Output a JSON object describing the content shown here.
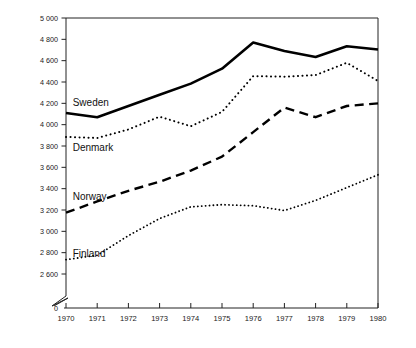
{
  "chart_data": {
    "type": "line",
    "title": "",
    "subtitle": "",
    "xlabel": "",
    "ylabel": "",
    "x": [
      1970,
      1971,
      1972,
      1973,
      1974,
      1975,
      1976,
      1977,
      1978,
      1979,
      1980
    ],
    "xtick_labels": [
      "1970",
      "1971",
      "1972",
      "1973",
      "1974",
      "1975",
      "1976",
      "1977",
      "1978",
      "1979",
      "1980"
    ],
    "ytick_labels": [
      "0",
      "2 600",
      "2 800",
      "3 000",
      "3 200",
      "3 400",
      "3 600",
      "3 800",
      "4 000",
      "4 200",
      "4 400",
      "4 600",
      "4 800",
      "5 000"
    ],
    "ytick_values": [
      0,
      2600,
      2800,
      3000,
      3200,
      3400,
      3600,
      3800,
      4000,
      4200,
      4400,
      4600,
      4800,
      5000
    ],
    "ylim": [
      2600,
      5000
    ],
    "xlim": [
      1970,
      1980
    ],
    "axis_break": true,
    "axis_break_note": "y-axis broken between 0 and 2 600",
    "grid": false,
    "legend_position": "inline-left",
    "series": [
      {
        "name": "Sweden",
        "style": "solid",
        "linewidth": 2.6,
        "color": "#000000",
        "label_x": 1970.15,
        "label_y": 4210,
        "values": [
          4110,
          4070,
          4175,
          4280,
          4385,
          4525,
          4770,
          4690,
          4635,
          4735,
          4705
        ]
      },
      {
        "name": "Denmark",
        "style": "dotted",
        "linewidth": 2.0,
        "color": "#000000",
        "label_x": 1970.15,
        "label_y": 3790,
        "values": [
          3885,
          3875,
          3955,
          4075,
          3985,
          4120,
          4455,
          4450,
          4465,
          4580,
          4410
        ]
      },
      {
        "name": "Norway",
        "style": "dashed",
        "linewidth": 2.4,
        "color": "#000000",
        "label_x": 1970.15,
        "label_y": 3330,
        "values": [
          3175,
          3280,
          3380,
          3465,
          3570,
          3700,
          3930,
          4160,
          4070,
          4175,
          4200
        ]
      },
      {
        "name": "Finland",
        "style": "fine-dotted",
        "linewidth": 1.8,
        "color": "#000000",
        "label_x": 1970.15,
        "label_y": 2790,
        "values": [
          2735,
          2775,
          2960,
          3120,
          3230,
          3250,
          3240,
          3195,
          3290,
          3410,
          3530
        ]
      }
    ]
  }
}
